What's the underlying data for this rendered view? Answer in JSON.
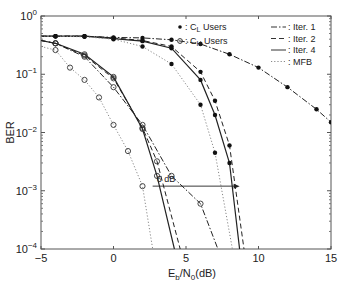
{
  "chart_data": {
    "type": "line",
    "title": "",
    "xlabel": "E_b/N_0(dB)",
    "ylabel": "BER",
    "xscale": "linear",
    "yscale": "log",
    "xlim": [
      -5,
      15
    ],
    "ylim": [
      0.0001,
      1
    ],
    "xticks": [
      "-5",
      "0",
      "5",
      "10",
      "15"
    ],
    "yticks": [
      "10^0",
      "10^-1",
      "10^-2",
      "10^-3",
      "10^-4"
    ],
    "grid": false,
    "legend": {
      "position": "upper right",
      "markers": [
        {
          "marker": "*",
          "label": "C_L Users"
        },
        {
          "marker": "o",
          "label": "C_H Users"
        }
      ],
      "lines": [
        {
          "style": "dash-dot",
          "label": "Iter. 1"
        },
        {
          "style": "dashed",
          "label": "Iter. 2"
        },
        {
          "style": "solid",
          "label": "Iter. 4"
        },
        {
          "style": "dotted",
          "label": "MFB"
        }
      ]
    },
    "annotation": {
      "text": "6 dB",
      "arrow_from": [
        2.7,
        0.0012
      ],
      "arrow_to": [
        8.7,
        0.0012
      ]
    },
    "series": [
      {
        "name": "C_L Iter. 1",
        "group": "C_L",
        "style": "dash-dot",
        "marker": "*",
        "x": [
          -5,
          -4,
          -2,
          0,
          2,
          4,
          6,
          8,
          10,
          12,
          14,
          15
        ],
        "y": [
          0.45,
          0.45,
          0.45,
          0.43,
          0.42,
          0.39,
          0.33,
          0.22,
          0.13,
          0.06,
          0.025,
          0.015
        ]
      },
      {
        "name": "C_L Iter. 2",
        "group": "C_L",
        "style": "dashed",
        "marker": "*",
        "x": [
          -5,
          -4,
          -2,
          0,
          2,
          4,
          6,
          7,
          8,
          9
        ],
        "y": [
          0.45,
          0.45,
          0.45,
          0.42,
          0.38,
          0.3,
          0.11,
          0.035,
          0.006,
          0.0001
        ]
      },
      {
        "name": "C_L Iter. 4",
        "group": "C_L",
        "style": "solid",
        "marker": "*",
        "x": [
          -5,
          -4,
          -2,
          0,
          2,
          4,
          6,
          7,
          8,
          8.7
        ],
        "y": [
          0.45,
          0.45,
          0.45,
          0.41,
          0.37,
          0.28,
          0.08,
          0.02,
          0.003,
          0.0001
        ]
      },
      {
        "name": "C_L MFB",
        "group": "C_L",
        "style": "dotted",
        "marker": "*",
        "x": [
          -5,
          -4,
          -2,
          0,
          2,
          4,
          6,
          7,
          8.2
        ],
        "y": [
          0.45,
          0.45,
          0.44,
          0.4,
          0.3,
          0.15,
          0.03,
          0.0045,
          0.0001
        ]
      },
      {
        "name": "C_H Iter. 1",
        "group": "C_H",
        "style": "dash-dot",
        "marker": "o",
        "x": [
          -5,
          -4,
          -2,
          0,
          2,
          4,
          6,
          7.2
        ],
        "y": [
          0.38,
          0.34,
          0.2,
          0.06,
          0.0135,
          0.0018,
          0.0006,
          0.0001
        ]
      },
      {
        "name": "C_H Iter. 2",
        "group": "C_H",
        "style": "dashed",
        "marker": "o",
        "x": [
          -5,
          -4,
          -2,
          0,
          2,
          3,
          4.6
        ],
        "y": [
          0.38,
          0.34,
          0.21,
          0.085,
          0.012,
          0.0032,
          0.0001
        ]
      },
      {
        "name": "C_H Iter. 4",
        "group": "C_H",
        "style": "solid",
        "marker": "o",
        "x": [
          -5,
          -4,
          -2,
          0,
          2,
          3,
          4.2
        ],
        "y": [
          0.38,
          0.34,
          0.22,
          0.09,
          0.0115,
          0.0018,
          0.0001
        ]
      },
      {
        "name": "C_H MFB",
        "group": "C_H",
        "style": "dotted",
        "marker": "o",
        "x": [
          -5,
          -4,
          -3,
          -2,
          -1,
          0,
          1,
          2,
          2.7
        ],
        "y": [
          0.3,
          0.26,
          0.13,
          0.08,
          0.04,
          0.0135,
          0.0048,
          0.0012,
          0.0001
        ]
      }
    ]
  }
}
